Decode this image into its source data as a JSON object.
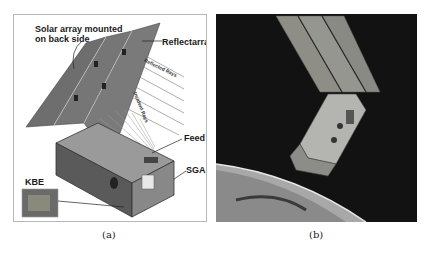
{
  "figure": {
    "subfigures": [
      {
        "id": "a",
        "caption": "(a)",
        "labels": {
          "solar_array": "Solar array mounted\non back side",
          "solar_array_line1": "Solar array mounted",
          "solar_array_line2": "on back side",
          "reflectarray": "Reflectarray",
          "reflected_rays": "Reflected Rays",
          "incident_rays": "Incident Rays",
          "feed": "Feed",
          "sga": "SGA",
          "kbe": "KBE"
        }
      },
      {
        "id": "b",
        "caption": "(b)"
      }
    ]
  }
}
